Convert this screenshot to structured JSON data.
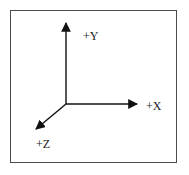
{
  "diagram": {
    "type": "coordinate-axes",
    "colors": {
      "border": "#4a4a4a",
      "axis": "#111111",
      "label": "#222222",
      "background": "#ffffff"
    },
    "origin": {
      "x": 66,
      "y": 104
    },
    "axes": [
      {
        "id": "y",
        "label": "+Y",
        "direction": "up",
        "tip": {
          "x": 66,
          "y": 23
        }
      },
      {
        "id": "x",
        "label": "+X",
        "direction": "right",
        "tip": {
          "x": 137,
          "y": 104
        }
      },
      {
        "id": "z",
        "label": "+Z",
        "direction": "down-left",
        "tip": {
          "x": 36,
          "y": 129
        }
      }
    ]
  }
}
